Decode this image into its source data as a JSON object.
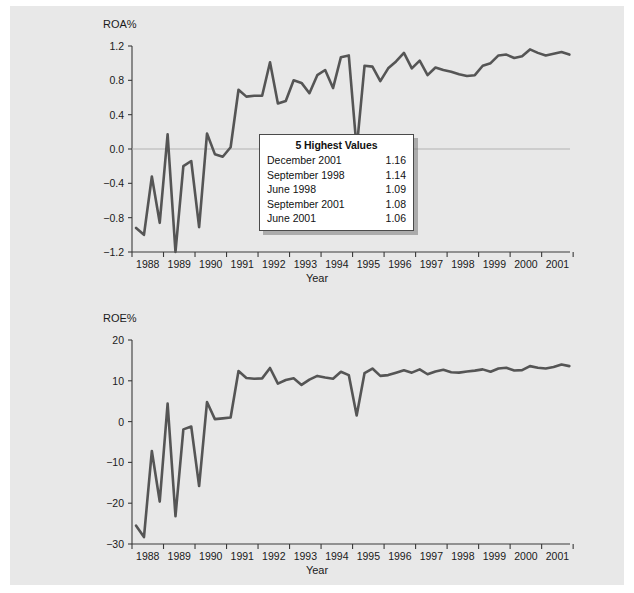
{
  "charts": [
    {
      "id": "roa",
      "ylabel": "ROA%",
      "xlabel": "Year",
      "yticks": [
        "1.2",
        "0.8",
        "0.4",
        "0.0",
        "-0.4",
        "-0.8",
        "-1.2"
      ],
      "legend": {
        "title": "5 Highest Values",
        "rows": [
          {
            "label": "December 2001",
            "value": "1.16"
          },
          {
            "label": "September 1998",
            "value": "1.14"
          },
          {
            "label": "June 1998",
            "value": "1.09"
          },
          {
            "label": "September 2001",
            "value": "1.08"
          },
          {
            "label": "June 2001",
            "value": "1.06"
          }
        ]
      }
    },
    {
      "id": "roe",
      "ylabel": "ROE%",
      "xlabel": "Year",
      "yticks": [
        "20",
        "10",
        "0",
        "-10",
        "-20",
        "-30"
      ],
      "legend": {
        "title": "5 Highest Values",
        "rows": [
          {
            "label": "December 2001",
            "value": "13.60"
          },
          {
            "label": "March 1993",
            "value": "13.14"
          },
          {
            "label": "September 1998",
            "value": "12.71"
          },
          {
            "label": "September 2001",
            "value": "12.61"
          },
          {
            "label": "June 2001",
            "value": "12.52"
          }
        ]
      }
    }
  ],
  "chart_data": [
    {
      "type": "line",
      "title": "",
      "ylabel": "ROA%",
      "xlabel": "Year",
      "ylim": [
        -1.2,
        1.2
      ],
      "xlim": [
        1988.0,
        2001.9
      ],
      "grid": false,
      "legend_position": "inside-center",
      "xtick_labels": [
        "1988",
        "1989",
        "1990",
        "1991",
        "1992",
        "1993",
        "1994",
        "1995",
        "1996",
        "1997",
        "1998",
        "1999",
        "2000",
        "2001"
      ],
      "ytick_labels": [
        "1.2",
        "0.8",
        "0.4",
        "0.0",
        "-0.4",
        "-0.8",
        "-1.2"
      ],
      "x": [
        1988.13,
        1988.38,
        1988.63,
        1988.88,
        1989.13,
        1989.38,
        1989.63,
        1989.88,
        1990.13,
        1990.38,
        1990.63,
        1990.88,
        1991.13,
        1991.38,
        1991.63,
        1991.88,
        1992.13,
        1992.38,
        1992.63,
        1992.88,
        1993.13,
        1993.38,
        1993.63,
        1993.88,
        1994.13,
        1994.38,
        1994.63,
        1994.88,
        1995.13,
        1995.38,
        1995.63,
        1995.88,
        1996.13,
        1996.38,
        1996.63,
        1996.88,
        1997.13,
        1997.38,
        1997.63,
        1997.88,
        1998.13,
        1998.38,
        1998.63,
        1998.88,
        1999.13,
        1999.38,
        1999.63,
        1999.88,
        2000.13,
        2000.38,
        2000.63,
        2000.88,
        2001.13,
        2001.38,
        2001.63,
        2001.88
      ],
      "y": [
        -0.92,
        -1.0,
        -0.32,
        -0.86,
        0.17,
        -1.2,
        -0.2,
        -0.14,
        -0.91,
        0.18,
        -0.06,
        -0.09,
        0.02,
        0.69,
        0.61,
        0.62,
        0.62,
        1.01,
        0.53,
        0.56,
        0.8,
        0.77,
        0.65,
        0.86,
        0.92,
        0.71,
        1.07,
        1.09,
        0.0,
        0.97,
        0.96,
        0.79,
        0.94,
        1.02,
        1.12,
        0.94,
        1.03,
        0.86,
        0.95,
        0.92,
        0.9,
        0.87,
        0.85,
        0.86,
        0.97,
        1.0,
        1.09,
        1.1,
        1.06,
        1.08,
        1.16,
        1.12,
        1.09,
        1.11,
        1.13,
        1.1
      ],
      "series_note": "Quarterly return on assets, 1988Q1-2001Q4",
      "annotations": {
        "highest_values": [
          {
            "period": "December 2001",
            "value": 1.16
          },
          {
            "period": "September 1998",
            "value": 1.14
          },
          {
            "period": "June 1998",
            "value": 1.09
          },
          {
            "period": "September 2001",
            "value": 1.08
          },
          {
            "period": "June 2001",
            "value": 1.06
          }
        ]
      }
    },
    {
      "type": "line",
      "title": "",
      "ylabel": "ROE%",
      "xlabel": "Year",
      "ylim": [
        -30,
        20
      ],
      "xlim": [
        1988.0,
        2001.9
      ],
      "grid": false,
      "legend_position": "inside-center",
      "xtick_labels": [
        "1988",
        "1989",
        "1990",
        "1991",
        "1992",
        "1993",
        "1994",
        "1995",
        "1996",
        "1997",
        "1998",
        "1999",
        "2000",
        "2001"
      ],
      "ytick_labels": [
        "20",
        "10",
        "0",
        "-10",
        "-20",
        "-30"
      ],
      "x": [
        1988.13,
        1988.38,
        1988.63,
        1988.88,
        1989.13,
        1989.38,
        1989.63,
        1989.88,
        1990.13,
        1990.38,
        1990.63,
        1990.88,
        1991.13,
        1991.38,
        1991.63,
        1991.88,
        1992.13,
        1992.38,
        1992.63,
        1992.88,
        1993.13,
        1993.38,
        1993.63,
        1993.88,
        1994.13,
        1994.38,
        1994.63,
        1994.88,
        1995.13,
        1995.38,
        1995.63,
        1995.88,
        1996.13,
        1996.38,
        1996.63,
        1996.88,
        1997.13,
        1997.38,
        1997.63,
        1997.88,
        1998.13,
        1998.38,
        1998.63,
        1998.88,
        1999.13,
        1999.38,
        1999.63,
        1999.88,
        2000.13,
        2000.38,
        2000.63,
        2000.88,
        2001.13,
        2001.38,
        2001.63,
        2001.88
      ],
      "y": [
        -25.5,
        -28.3,
        -7.2,
        -19.6,
        4.4,
        -23.2,
        -1.9,
        -1.2,
        -15.8,
        4.8,
        0.6,
        0.8,
        1.0,
        12.4,
        10.7,
        10.5,
        10.6,
        13.14,
        9.3,
        10.2,
        10.6,
        9.0,
        10.3,
        11.2,
        10.8,
        10.5,
        12.2,
        11.4,
        1.5,
        11.9,
        13.0,
        11.2,
        11.4,
        12.0,
        12.6,
        12.0,
        12.8,
        11.6,
        12.3,
        12.71,
        12.1,
        12.0,
        12.3,
        12.5,
        12.8,
        12.2,
        13.0,
        13.2,
        12.52,
        12.61,
        13.6,
        13.2,
        13.0,
        13.4,
        14.0,
        13.6
      ],
      "series_note": "Quarterly return on equity, 1988Q1-2001Q4",
      "annotations": {
        "highest_values": [
          {
            "period": "December 2001",
            "value": 13.6
          },
          {
            "period": "March 1993",
            "value": 13.14
          },
          {
            "period": "September 1998",
            "value": 12.71
          },
          {
            "period": "September 2001",
            "value": 12.61
          },
          {
            "period": "June 2001",
            "value": 12.52
          }
        ]
      }
    }
  ]
}
